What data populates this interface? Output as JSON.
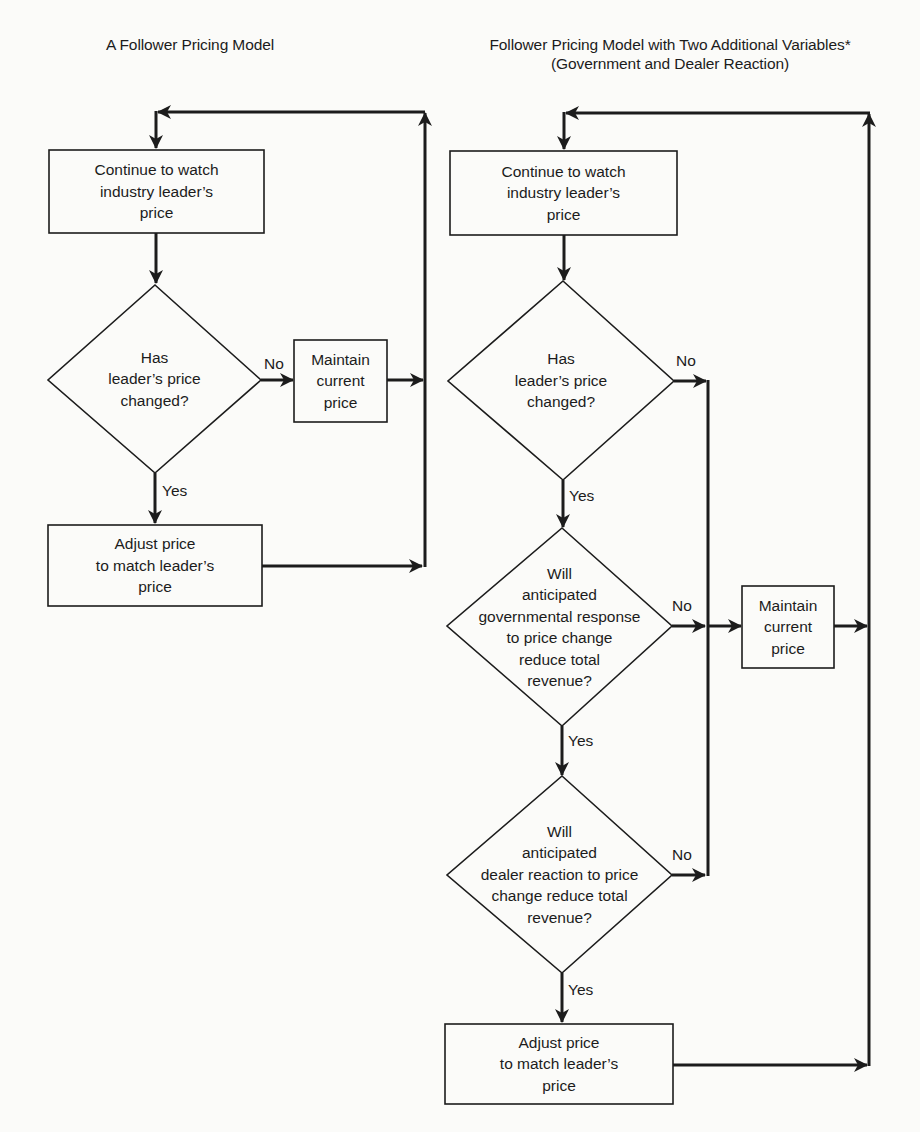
{
  "diagram": {
    "header_fragment": "",
    "left_model": {
      "title": "A Follower Pricing Model",
      "nodes": {
        "watch": {
          "lines": [
            "Continue to watch",
            "industry leader’s",
            "price"
          ]
        },
        "decision_changed": {
          "lines": [
            "Has",
            "leader’s price",
            "changed?"
          ]
        },
        "maintain": {
          "lines": [
            "Maintain",
            "current",
            "price"
          ]
        },
        "adjust": {
          "lines": [
            "Adjust price",
            "to match leader’s",
            "price"
          ]
        }
      },
      "edges": {
        "changed_no": "No",
        "changed_yes": "Yes"
      }
    },
    "right_model": {
      "title_line1": "Follower Pricing Model with Two Additional Variables*",
      "title_line2": "(Government and Dealer Reaction)",
      "nodes": {
        "watch": {
          "lines": [
            "Continue to watch",
            "industry leader’s",
            "price"
          ]
        },
        "decision_changed": {
          "lines": [
            "Has",
            "leader’s price",
            "changed?"
          ]
        },
        "decision_government": {
          "lines": [
            "Will",
            "anticipated",
            "governmental response",
            "to price change",
            "reduce total",
            "revenue?"
          ]
        },
        "decision_dealer": {
          "lines": [
            "Will",
            "anticipated",
            "dealer reaction to price",
            "change reduce total",
            "revenue?"
          ]
        },
        "maintain": {
          "lines": [
            "Maintain",
            "current",
            "price"
          ]
        },
        "adjust": {
          "lines": [
            "Adjust price",
            "to match leader’s",
            "price"
          ]
        }
      },
      "edges": {
        "changed_no": "No",
        "changed_yes": "Yes",
        "government_no": "No",
        "government_yes": "Yes",
        "dealer_no": "No",
        "dealer_yes": "Yes"
      }
    }
  },
  "colors": {
    "ink": "#1c1c1c",
    "paper": "#fbfbf9"
  }
}
